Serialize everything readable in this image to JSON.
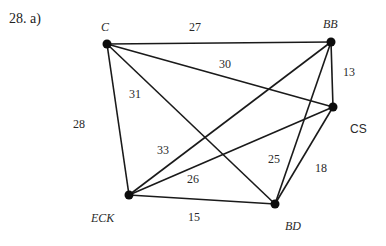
{
  "problem": {
    "label": "28.  a)"
  },
  "graph": {
    "nodes": [
      {
        "id": "C",
        "label": "C",
        "x": 107,
        "y": 44,
        "label_x": 101,
        "label_y": 31,
        "style": "italic"
      },
      {
        "id": "BB",
        "label": "BB",
        "x": 331,
        "y": 42,
        "label_x": 323,
        "label_y": 28,
        "style": "italic"
      },
      {
        "id": "CS",
        "label": "CS",
        "x": 333,
        "y": 107,
        "label_x": 350,
        "label_y": 133,
        "style": "sans"
      },
      {
        "id": "ECK",
        "label": "ECK",
        "x": 129,
        "y": 195,
        "label_x": 91,
        "label_y": 222,
        "style": "italic"
      },
      {
        "id": "BD",
        "label": "BD",
        "x": 275,
        "y": 204,
        "label_x": 285,
        "label_y": 230,
        "style": "italic"
      }
    ],
    "edges": [
      {
        "from": "C",
        "to": "BB",
        "weight": "27",
        "label_x": 195,
        "label_y": 31
      },
      {
        "from": "C",
        "to": "CS",
        "weight": "30",
        "label_x": 225,
        "label_y": 68
      },
      {
        "from": "C",
        "to": "BD",
        "weight": "31",
        "label_x": 135,
        "label_y": 98
      },
      {
        "from": "C",
        "to": "ECK",
        "weight": "28",
        "label_x": 79,
        "label_y": 128
      },
      {
        "from": "ECK",
        "to": "BB",
        "weight": "33",
        "label_x": 163,
        "label_y": 154
      },
      {
        "from": "ECK",
        "to": "CS",
        "weight": "26",
        "label_x": 193,
        "label_y": 183
      },
      {
        "from": "ECK",
        "to": "BD",
        "weight": "15",
        "label_x": 194,
        "label_y": 221
      },
      {
        "from": "BB",
        "to": "CS",
        "weight": "13",
        "label_x": 349,
        "label_y": 76
      },
      {
        "from": "BB",
        "to": "BD",
        "weight": "25",
        "label_x": 274,
        "label_y": 163
      },
      {
        "from": "CS",
        "to": "BD",
        "weight": "18",
        "label_x": 321,
        "label_y": 172
      }
    ]
  }
}
